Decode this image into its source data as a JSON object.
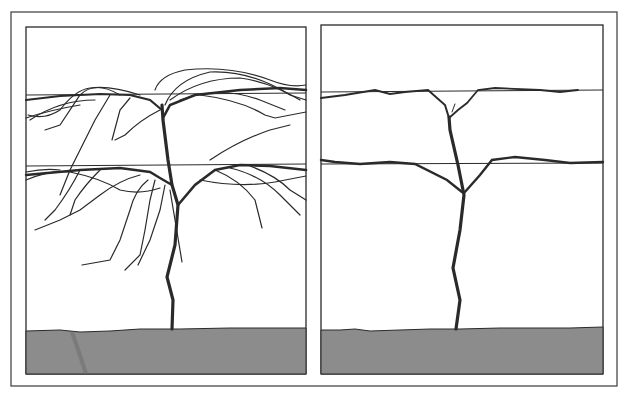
{
  "figure": {
    "type": "illustration",
    "panels": [
      {
        "id": "left",
        "description": "unpruned sprawling vine with many drooping canes over two trellis wires",
        "wires": 2
      },
      {
        "id": "right",
        "description": "pruned vine trained as double-tier cordon along two trellis wires",
        "wires": 2
      }
    ],
    "colors": {
      "background": "#ffffff",
      "line": "#2a2a2a",
      "ground": "#8c8c8c",
      "frame": "#3a3a3a"
    }
  }
}
